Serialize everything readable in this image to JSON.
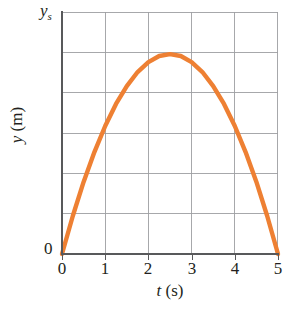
{
  "figure": {
    "background_color": "#ffffff",
    "axis_color": "#58595b",
    "grid_color": "#9d9fa2",
    "text_color": "#231f20",
    "curve_color": "#ee8033"
  },
  "axes": {
    "x_title_variable": "t",
    "x_title_unit": " (s)",
    "y_title_variable": "y",
    "y_title_unit": " (m)",
    "y_origin_label": "0",
    "y_top_label_variable": "y",
    "y_top_label_subscript": "s",
    "x_tick_labels": [
      "0",
      "1",
      "2",
      "3",
      "4",
      "5"
    ]
  },
  "chart_data": {
    "type": "line",
    "title": "",
    "xlabel": "t (s)",
    "ylabel": "y (m)",
    "xlim": [
      0,
      5
    ],
    "ylim": [
      0,
      1
    ],
    "xticks": [
      0,
      1,
      2,
      3,
      4,
      5
    ],
    "xticklabels": [
      "0",
      "1",
      "2",
      "3",
      "4",
      "5"
    ],
    "yticks": [
      0,
      1
    ],
    "yticklabels": [
      "0",
      "ys"
    ],
    "grid": true,
    "grid_x_lines": [
      1,
      2,
      3,
      4,
      5
    ],
    "grid_y_fraction_lines": [
      0.1667,
      0.3333,
      0.5,
      0.6667,
      0.8333
    ],
    "legend": null,
    "series": [
      {
        "name": "y(t)",
        "note": "projectile height, parabola y = 0.8264*(5t - t^2)/6.25 normalized so peak = 0.8264 of y_s at t = 2.5 s",
        "x": [
          0.0,
          0.25,
          0.5,
          0.75,
          1.0,
          1.25,
          1.5,
          1.75,
          2.0,
          2.25,
          2.5,
          2.75,
          3.0,
          3.25,
          3.5,
          3.75,
          4.0,
          4.25,
          4.5,
          4.75,
          5.0
        ],
        "y": [
          0.0,
          0.157,
          0.298,
          0.421,
          0.529,
          0.62,
          0.694,
          0.752,
          0.793,
          0.818,
          0.826,
          0.818,
          0.793,
          0.752,
          0.694,
          0.62,
          0.529,
          0.421,
          0.298,
          0.157,
          0.0
        ]
      }
    ],
    "annotations": [
      {
        "text": "ys",
        "position": "y-axis top",
        "meaning": "maximum height marker"
      },
      {
        "text": "0",
        "position": "origin"
      }
    ]
  }
}
